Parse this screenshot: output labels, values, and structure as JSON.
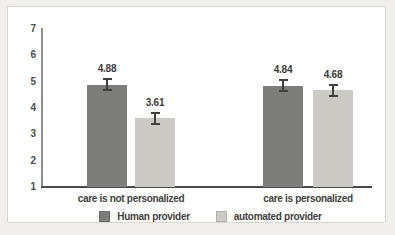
{
  "chart_data": {
    "type": "bar",
    "title": "",
    "categories": [
      "care is not personalized",
      "care is personalized"
    ],
    "series": [
      {
        "name": "Human provider",
        "color": "#7d7d7b",
        "values": [
          4.88,
          4.84
        ]
      },
      {
        "name": "automated provider",
        "color": "#cbcac4",
        "values": [
          3.61,
          4.68
        ]
      }
    ],
    "value_labels": [
      "4.88",
      "3.61",
      "4.84",
      "4.68"
    ],
    "error_bar": 0.25,
    "yticks": [
      1,
      2,
      3,
      4,
      5,
      6,
      7
    ],
    "ylim": [
      1,
      7
    ],
    "xlabel": "",
    "ylabel": "",
    "grid": false,
    "legend_position": "bottom"
  },
  "colors": {
    "background": "#f0efeb",
    "panel": "#ffffff",
    "panel_border": "#d6d5d0",
    "x_axis": "#4a4a49",
    "y_axis": "#8f8f8e",
    "error_bar": "#3f3f3e",
    "text": "#3f3f3e"
  }
}
